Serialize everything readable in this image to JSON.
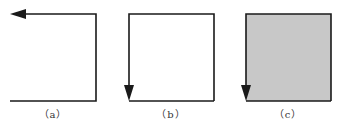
{
  "figure": {
    "panels": [
      {
        "id": "a",
        "label": "（a）",
        "filled": false,
        "description": "Open path: bottom line to right, up right side, then along top leftward ending in arrow pointing left"
      },
      {
        "id": "b",
        "label": "（b）",
        "filled": false,
        "description": "Open square path: starts at bottom-right, goes up right side, left along top, down left side ending in arrow pointing down"
      },
      {
        "id": "c",
        "label": "（c）",
        "filled": true,
        "fill_color": "#c8c8c8",
        "description": "Same path as (b) with gray filled interior, arrow pointing down at bottom-left"
      }
    ],
    "colors": {
      "stroke": "#1a1a1a",
      "fill": "#c8c8c8",
      "background": "#ffffff"
    }
  }
}
